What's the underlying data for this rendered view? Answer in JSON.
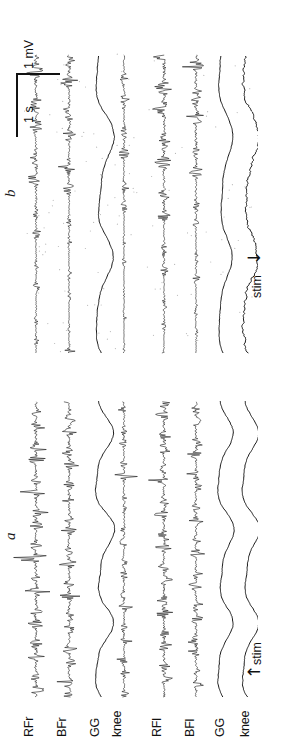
{
  "figure": {
    "orientation": "rotated-90",
    "background": "#ffffff",
    "trace_color": "#1a1a1a"
  },
  "panels": [
    {
      "id": "a",
      "label": "a",
      "stim_label": "stim",
      "stim_arrow": "↑"
    },
    {
      "id": "b",
      "label": "b",
      "stim_label": "stim",
      "stim_arrow": "↓"
    }
  ],
  "channels": [
    {
      "key": "rfr",
      "label": "RFr",
      "type": "emg"
    },
    {
      "key": "bfr",
      "label": "BFr",
      "type": "emg"
    },
    {
      "key": "ggr",
      "label": "GG",
      "type": "emg"
    },
    {
      "key": "kneer",
      "label": "knee",
      "type": "angle"
    },
    {
      "key": "rfl",
      "label": "RFl",
      "type": "emg"
    },
    {
      "key": "bfl",
      "label": "BFl",
      "type": "emg"
    },
    {
      "key": "ggl",
      "label": "GG",
      "type": "angle"
    },
    {
      "key": "kneel",
      "label": "knee",
      "type": "angle"
    }
  ],
  "scalebars": {
    "time": {
      "label": "1 s",
      "value": 1,
      "unit": "s"
    },
    "amplitude": {
      "label": "1 mV",
      "value": 1,
      "unit": "mV"
    }
  },
  "chart_data": {
    "type": "line",
    "xlabel": "time",
    "ylabel": "amplitude",
    "grid": false,
    "legend": "none",
    "scale_time_s": 1,
    "scale_amplitude_mV": 1,
    "panels": [
      {
        "id": "a",
        "stim_marker": "stim",
        "series": [
          {
            "name": "RFr",
            "kind": "emg",
            "burst_rate_hz": 2.6,
            "amplitude_mV": 0.95,
            "description": "dense rhythmic high-amplitude EMG bursts throughout"
          },
          {
            "name": "BFr",
            "kind": "emg",
            "burst_rate_hz": 2.6,
            "amplitude_mV": 0.75,
            "description": "rhythmic bursts alternating with RFr"
          },
          {
            "name": "GG",
            "kind": "angle",
            "cycle_rate_hz": 0.9,
            "amplitude_mV": 0.35,
            "description": "smooth slow oscillation"
          },
          {
            "name": "knee",
            "kind": "emg",
            "burst_rate_hz": 2.6,
            "amplitude_mV": 0.7,
            "description": "rhythmic EMG bursts"
          },
          {
            "name": "RFl",
            "kind": "emg",
            "burst_rate_hz": 2.6,
            "amplitude_mV": 0.8,
            "description": "rhythmic EMG bursts"
          },
          {
            "name": "BFl",
            "kind": "emg",
            "burst_rate_hz": 2.6,
            "amplitude_mV": 0.6,
            "description": "rhythmic EMG bursts"
          },
          {
            "name": "GG",
            "kind": "angle",
            "cycle_rate_hz": 0.9,
            "amplitude_mV": 0.3,
            "description": "smooth slow oscillation"
          },
          {
            "name": "knee",
            "kind": "angle",
            "cycle_rate_hz": 0.9,
            "amplitude_mV": 0.33,
            "description": "smooth slow oscillation"
          }
        ]
      },
      {
        "id": "b",
        "stim_marker": "stim",
        "series": [
          {
            "name": "RFr",
            "kind": "emg",
            "burst_rate_hz": 1.6,
            "amplitude_mV": 0.6,
            "description": "sparse low tonic EMG before stim, larger bursts after"
          },
          {
            "name": "BFr",
            "kind": "emg",
            "burst_rate_hz": 1.6,
            "amplitude_mV": 0.45,
            "description": "low tonic activity with intermittent bursts"
          },
          {
            "name": "GG",
            "kind": "angle",
            "cycle_rate_hz": 0.7,
            "amplitude_mV": 0.3,
            "description": "slow oscillation, increasing after stim"
          },
          {
            "name": "knee",
            "kind": "emg",
            "burst_rate_hz": 1.6,
            "amplitude_mV": 0.5,
            "description": "low tonic EMG with bursts after stim"
          },
          {
            "name": "RFl",
            "kind": "emg",
            "burst_rate_hz": 1.6,
            "amplitude_mV": 0.85,
            "description": "large bursts concentrated after stim"
          },
          {
            "name": "BFl",
            "kind": "emg",
            "burst_rate_hz": 1.6,
            "amplitude_mV": 0.55,
            "description": "bursts after stim"
          },
          {
            "name": "GG",
            "kind": "angle",
            "cycle_rate_hz": 0.7,
            "amplitude_mV": 0.25,
            "description": "slow oscillation"
          },
          {
            "name": "knee",
            "kind": "angle",
            "cycle_rate_hz": 0.7,
            "amplitude_mV": 0.28,
            "description": "noisy slow oscillation"
          }
        ]
      }
    ]
  }
}
